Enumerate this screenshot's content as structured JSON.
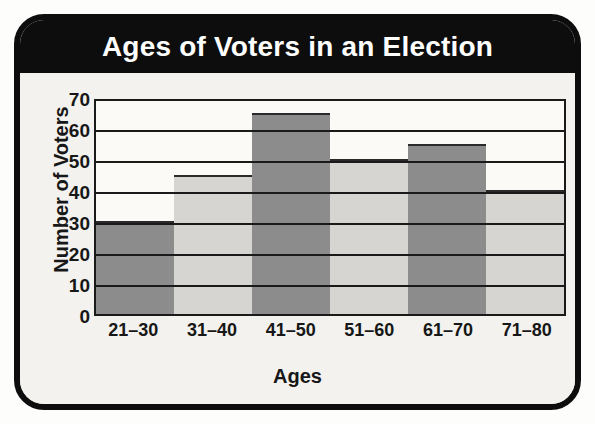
{
  "chart_data": {
    "type": "bar",
    "title": "Ages of Voters in an Election",
    "xlabel": "Ages",
    "ylabel": "Number of Voters",
    "categories": [
      "21–30",
      "31–40",
      "41–50",
      "51–60",
      "61–70",
      "71–80"
    ],
    "values": [
      30,
      45,
      65,
      50,
      55,
      40
    ],
    "bar_colors": [
      "#8c8c8c",
      "#d6d5d2",
      "#8c8c8c",
      "#d6d5d2",
      "#8c8c8c",
      "#d6d5d2"
    ],
    "ylim": [
      0,
      70
    ],
    "ytick_step": 10,
    "yticks": [
      70,
      60,
      50,
      40,
      30,
      20,
      10,
      0
    ],
    "gridlines": [
      70,
      60,
      50,
      40,
      30,
      20,
      10
    ],
    "grid": true,
    "legend": null,
    "legend_position": "none"
  },
  "card": {
    "border_color": "#0d0d0d",
    "background": "#f3f2ee",
    "title_bar_color": "#0d0d0d",
    "title_text_color": "#ffffff"
  }
}
